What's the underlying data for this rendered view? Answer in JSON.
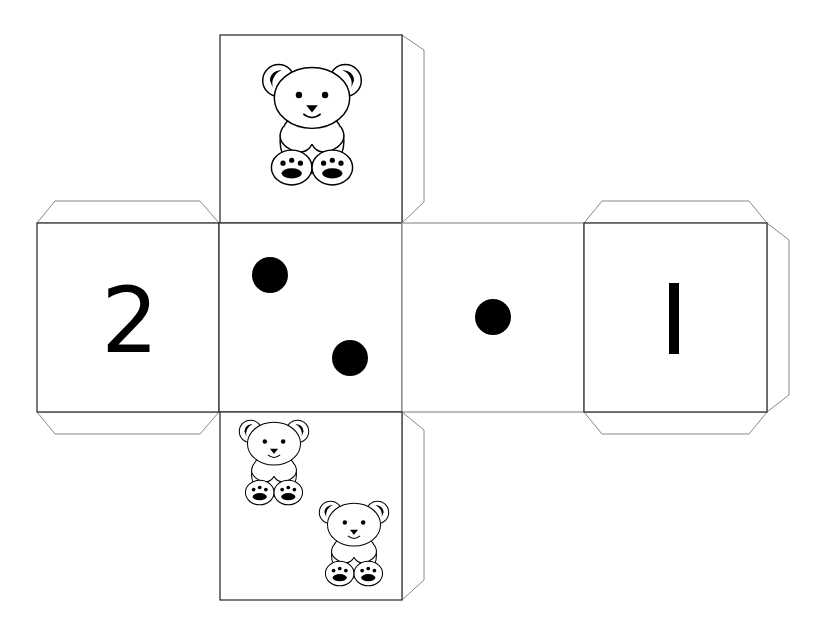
{
  "colors": {
    "background": "#ffffff",
    "outline": "#333333",
    "tab_outline": "#888888",
    "ink": "#000000"
  },
  "net": {
    "faces": [
      {
        "id": "top",
        "content_type": "bear-picture",
        "count": 1
      },
      {
        "id": "left",
        "content_type": "numeral",
        "value": "2"
      },
      {
        "id": "center-left",
        "content_type": "pips",
        "count": 2
      },
      {
        "id": "center-right",
        "content_type": "pips",
        "count": 1
      },
      {
        "id": "right",
        "content_type": "numeral",
        "value": "1"
      },
      {
        "id": "bottom",
        "content_type": "bear-picture",
        "count": 2
      }
    ],
    "labels": {
      "left_face_numeral": "2",
      "right_face_numeral": "1"
    }
  }
}
